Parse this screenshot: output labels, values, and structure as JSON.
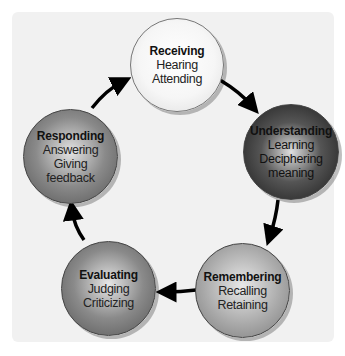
{
  "diagram": {
    "type": "cycle",
    "direction": "clockwise",
    "nodes": [
      {
        "id": "receiving",
        "title": "Receiving",
        "lines": [
          "Hearing",
          "Attending"
        ],
        "shade": "#f6f6f6"
      },
      {
        "id": "understanding",
        "title": "Understanding",
        "lines": [
          "Learning",
          "Deciphering",
          "meaning"
        ],
        "shade": "#2a2a2a"
      },
      {
        "id": "remembering",
        "title": "Remembering",
        "lines": [
          "Recalling",
          "Retaining"
        ],
        "shade": "#a8a8a8"
      },
      {
        "id": "evaluating",
        "title": "Evaluating",
        "lines": [
          "Judging",
          "Criticizing"
        ],
        "shade": "#808080"
      },
      {
        "id": "responding",
        "title": "Responding",
        "lines": [
          "Answering",
          "Giving",
          "feedback"
        ],
        "shade": "#808080"
      }
    ],
    "edges": [
      {
        "from": "receiving",
        "to": "understanding"
      },
      {
        "from": "understanding",
        "to": "remembering"
      },
      {
        "from": "remembering",
        "to": "evaluating"
      },
      {
        "from": "evaluating",
        "to": "responding"
      },
      {
        "from": "responding",
        "to": "receiving"
      }
    ]
  }
}
